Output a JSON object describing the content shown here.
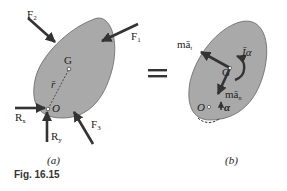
{
  "figure": {
    "caption": "Fig. 16.15",
    "panel_a": {
      "label": "(a)",
      "forces": [
        "F1",
        "F2",
        "F3"
      ],
      "reactions": [
        "Rx",
        "Ry"
      ],
      "points": [
        "G",
        "O"
      ],
      "vector_label": "r̄",
      "force_labels": {
        "F1": "F",
        "F1_sub": "1",
        "F2": "F",
        "F2_sub": "2",
        "F3": "F",
        "F3_sub": "3",
        "Rx": "R",
        "Rx_sub": "x",
        "Ry": "R",
        "Ry_sub": "y",
        "G": "G",
        "O": "O",
        "r": "r̄"
      }
    },
    "equals_sign": "=",
    "panel_b": {
      "label": "(b)",
      "labels": {
        "ma_t": "mā",
        "ma_t_sub": "t",
        "ma_n": "mā",
        "ma_n_sub": "n",
        "I_alpha": "Īα",
        "G": "G",
        "O": "O",
        "alpha": "α"
      }
    },
    "colors": {
      "body_fill": "#a9a9a9",
      "body_stroke": "#555555",
      "arrow": "#333333"
    }
  }
}
